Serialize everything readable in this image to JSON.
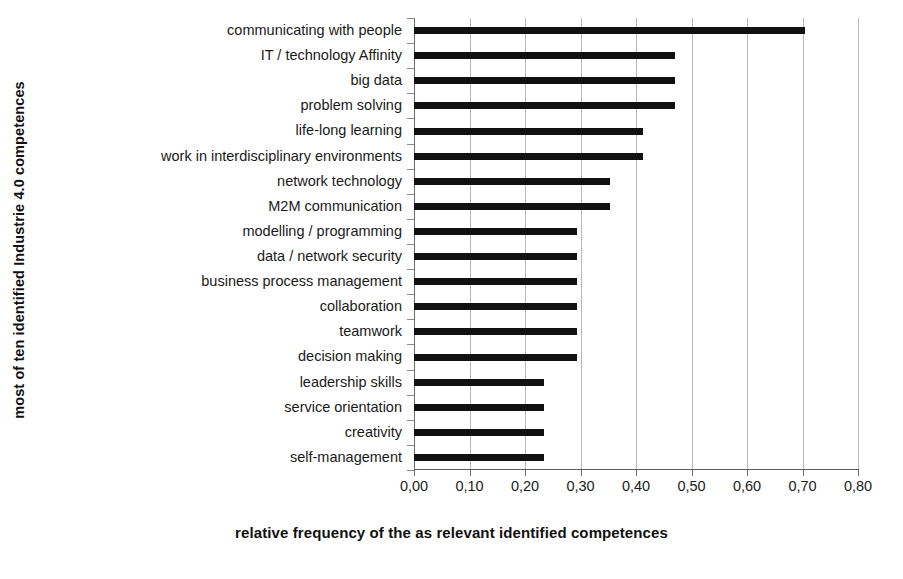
{
  "chart_data": {
    "type": "bar",
    "orientation": "horizontal",
    "title": "",
    "xlabel": "relative frequency of the as relevant identified competences",
    "ylabel": "most of ten identified Industrie 4.0 competences",
    "xlim": [
      0.0,
      0.8
    ],
    "xticks": [
      0.0,
      0.1,
      0.2,
      0.3,
      0.4,
      0.5,
      0.6,
      0.7,
      0.8
    ],
    "xtick_labels": [
      "0,00",
      "0,10",
      "0,20",
      "0,30",
      "0,40",
      "0,50",
      "0,60",
      "0,70",
      "0,80"
    ],
    "grid": true,
    "legend": false,
    "bar_color": "#111111",
    "gridline_color": "#b8b8b8",
    "categories": [
      "communicating with people",
      "IT / technology Affinity",
      "big data",
      "problem solving",
      "life-long learning",
      "work in interdisciplinary environments",
      "network technology",
      "M2M communication",
      "modelling / programming",
      "data / network security",
      "business process management",
      "collaboration",
      "teamwork",
      "decision making",
      "leadership skills",
      "service orientation",
      "creativity",
      "self-management"
    ],
    "values": [
      0.705,
      0.47,
      0.47,
      0.47,
      0.412,
      0.412,
      0.353,
      0.353,
      0.294,
      0.294,
      0.294,
      0.294,
      0.294,
      0.294,
      0.235,
      0.235,
      0.235,
      0.235
    ]
  }
}
